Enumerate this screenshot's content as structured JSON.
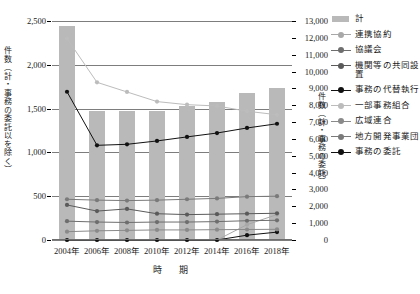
{
  "chart_data": {
    "type": "bar",
    "title": "",
    "xlabel": "時　期",
    "categories": [
      "2004年",
      "2006年",
      "2008年",
      "2010年",
      "2012年",
      "2014年",
      "2016年",
      "2018年"
    ],
    "left_axis": {
      "label": "件数（計・事務の委託以を除く）",
      "ylim": [
        0,
        2500
      ],
      "ticks": [
        "0",
        "500",
        "1,000",
        "1,500",
        "2,000",
        "2,500"
      ],
      "tick_values": [
        0,
        500,
        1000,
        1500,
        2000,
        2500
      ]
    },
    "right_axis": {
      "label": "件数（計・事務の委託）",
      "ylim": [
        0,
        13000
      ],
      "ticks": [
        "0",
        "1,000",
        "2,000",
        "3,000",
        "4,000",
        "5,000",
        "6,000",
        "7,000",
        "8,000",
        "9,000",
        "10,000",
        "11,000",
        "12,000",
        "13,000"
      ],
      "tick_values": [
        0,
        1000,
        2000,
        3000,
        4000,
        5000,
        6000,
        7000,
        8000,
        9000,
        10000,
        11000,
        12000,
        13000
      ]
    },
    "grid": true,
    "legend_position": "right",
    "series": [
      {
        "name": "計",
        "kind": "bar",
        "axis": "left",
        "color": "#b9b9b9",
        "values": [
          2440,
          1470,
          1470,
          1470,
          1530,
          1580,
          1680,
          1730
        ]
      },
      {
        "name": "連携協約",
        "kind": "line",
        "axis": "left",
        "color": "#a8a8a8",
        "values": [
          0,
          0,
          0,
          0,
          0,
          0,
          175,
          290
        ]
      },
      {
        "name": "協議会",
        "kind": "line",
        "axis": "left",
        "color": "#6e6e6e",
        "values": [
          215,
          205,
          200,
          205,
          205,
          210,
          220,
          225
        ]
      },
      {
        "name": "機関等の共同設置",
        "kind": "line",
        "axis": "left",
        "color": "#5a5a5a",
        "values": [
          400,
          330,
          355,
          300,
          290,
          295,
          300,
          305
        ]
      },
      {
        "name": "事務の代替執行",
        "kind": "line",
        "axis": "left",
        "color": "#111111",
        "values": [
          0,
          0,
          0,
          0,
          0,
          0,
          55,
          90
        ]
      },
      {
        "name": "一部事務組合",
        "kind": "line",
        "axis": "left",
        "color": "#bcbcbc",
        "values": [
          2300,
          1800,
          1690,
          1580,
          1545,
          1530,
          1470,
          1430
        ]
      },
      {
        "name": "広域連合",
        "kind": "line",
        "axis": "left",
        "color": "#8a8a8a",
        "values": [
          95,
          105,
          110,
          115,
          115,
          118,
          120,
          122
        ]
      },
      {
        "name": "地方開発事業団",
        "kind": "line",
        "axis": "left",
        "color": "#7a7a7a",
        "values": [
          465,
          455,
          450,
          455,
          465,
          475,
          495,
          500
        ]
      },
      {
        "name": "事務の委託",
        "kind": "line",
        "axis": "right",
        "color": "#111111",
        "values": [
          8800,
          5620,
          5680,
          5880,
          6120,
          6350,
          6650,
          6900
        ]
      }
    ]
  },
  "legend": {
    "items": [
      {
        "label": "計",
        "type": "bar"
      },
      {
        "label": "連携協約",
        "type": "line"
      },
      {
        "label": "協議会",
        "type": "line"
      },
      {
        "label": "機関等の共同設置",
        "type": "line"
      },
      {
        "label": "事務の代替執行",
        "type": "line"
      },
      {
        "label": "一部事務組合",
        "type": "line"
      },
      {
        "label": "広域連合",
        "type": "line"
      },
      {
        "label": "地方開発事業団",
        "type": "line"
      },
      {
        "label": "事務の委託",
        "type": "line"
      }
    ]
  }
}
